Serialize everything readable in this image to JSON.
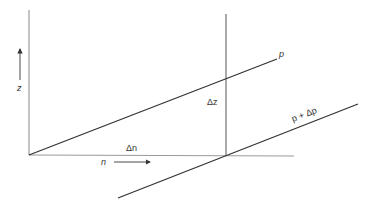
{
  "diagram": {
    "labels": {
      "z_axis": "z",
      "n_axis": "n",
      "delta_n": "Δn",
      "delta_z": "Δz",
      "line_p": "p",
      "line_p_dp": "p + Δp"
    },
    "colors": {
      "axis": "#9a9a9a",
      "line": "#333333",
      "background": "#ffffff"
    }
  }
}
